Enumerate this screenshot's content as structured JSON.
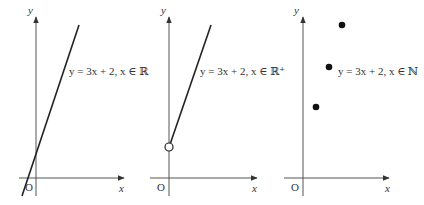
{
  "colors": {
    "axis": "#555555",
    "line": "#222222",
    "text": "#333333",
    "background": "#ffffff"
  },
  "panels": [
    {
      "id": "real",
      "y_label": "y",
      "x_label": "x",
      "origin_label": "O",
      "equation": "y = 3x + 2, x ∈ ℝ",
      "domain": "ℝ",
      "graph_type": "line"
    },
    {
      "id": "positive-real",
      "y_label": "y",
      "x_label": "x",
      "origin_label": "O",
      "equation": "y = 3x + 2, x ∈ ℝ⁺",
      "domain": "ℝ⁺",
      "graph_type": "ray-open-endpoint"
    },
    {
      "id": "natural",
      "y_label": "y",
      "x_label": "x",
      "origin_label": "O",
      "equation": "y = 3x + 2, x ∈ ℕ",
      "domain": "ℕ",
      "graph_type": "discrete-points"
    }
  ]
}
